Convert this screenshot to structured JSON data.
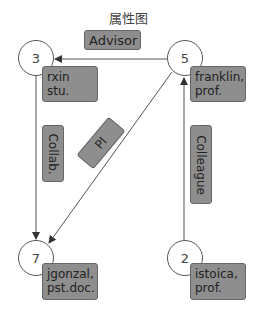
{
  "title": "属性图",
  "nodes": [
    {
      "id": "3",
      "label_line1": "rxin",
      "label_line2": "stu."
    },
    {
      "id": "5",
      "label_line1": "franklin,",
      "label_line2": "prof."
    },
    {
      "id": "7",
      "label_line1": "jgonzal,",
      "label_line2": "pst.doc."
    },
    {
      "id": "2",
      "label_line1": "istoica,",
      "label_line2": "prof."
    }
  ],
  "edges": [
    {
      "from": "5",
      "to": "3",
      "label": "Advisor"
    },
    {
      "from": "3",
      "to": "7",
      "label": "Collab."
    },
    {
      "from": "5",
      "to": "7",
      "label": "PI"
    },
    {
      "from": "2",
      "to": "5",
      "label": "Colleague"
    }
  ],
  "colors": {
    "label_fill": "#8e8e8e",
    "line": "#555555",
    "node_fill": "#ffffff"
  }
}
